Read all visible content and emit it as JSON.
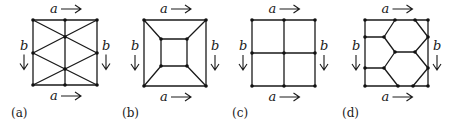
{
  "figure": {
    "panels": [
      {
        "id": "a",
        "caption": "(a)",
        "caption_pos": [
          11,
          117
        ],
        "edge_label_horizontal": "a",
        "edge_label_vertical": "b",
        "square": {
          "x0": 33,
          "y0": 20,
          "x1": 97,
          "y1": 85
        },
        "nodes": [
          [
            33,
            20
          ],
          [
            65,
            20
          ],
          [
            97,
            20
          ],
          [
            33,
            53
          ],
          [
            97,
            53
          ],
          [
            65,
            37
          ],
          [
            65,
            69
          ],
          [
            33,
            85
          ],
          [
            65,
            85
          ],
          [
            97,
            85
          ]
        ],
        "edges": [
          [
            [
              33,
              20
            ],
            [
              97,
              20
            ]
          ],
          [
            [
              33,
              85
            ],
            [
              97,
              85
            ]
          ],
          [
            [
              33,
              20
            ],
            [
              33,
              85
            ]
          ],
          [
            [
              97,
              20
            ],
            [
              97,
              85
            ]
          ],
          [
            [
              65,
              20
            ],
            [
              65,
              85
            ]
          ],
          [
            [
              33,
              20
            ],
            [
              97,
              53
            ]
          ],
          [
            [
              97,
              20
            ],
            [
              33,
              53
            ]
          ],
          [
            [
              33,
              53
            ],
            [
              97,
              85
            ]
          ],
          [
            [
              97,
              53
            ],
            [
              33,
              85
            ]
          ]
        ]
      },
      {
        "id": "b",
        "caption": "(b)",
        "caption_pos": [
          122,
          117
        ],
        "edge_label_horizontal": "a",
        "edge_label_vertical": "b",
        "square": {
          "x0": 144,
          "y0": 20,
          "x1": 206,
          "y1": 86
        },
        "nodes": [
          [
            144,
            20
          ],
          [
            206,
            20
          ],
          [
            144,
            86
          ],
          [
            206,
            86
          ],
          [
            161,
            39
          ],
          [
            187,
            39
          ],
          [
            161,
            66
          ],
          [
            187,
            66
          ]
        ],
        "edges": [
          [
            [
              144,
              20
            ],
            [
              206,
              20
            ]
          ],
          [
            [
              144,
              86
            ],
            [
              206,
              86
            ]
          ],
          [
            [
              144,
              20
            ],
            [
              144,
              86
            ]
          ],
          [
            [
              206,
              20
            ],
            [
              206,
              86
            ]
          ],
          [
            [
              161,
              39
            ],
            [
              187,
              39
            ]
          ],
          [
            [
              161,
              66
            ],
            [
              187,
              66
            ]
          ],
          [
            [
              161,
              39
            ],
            [
              161,
              66
            ]
          ],
          [
            [
              187,
              39
            ],
            [
              187,
              66
            ]
          ],
          [
            [
              144,
              20
            ],
            [
              161,
              39
            ]
          ],
          [
            [
              206,
              20
            ],
            [
              187,
              39
            ]
          ],
          [
            [
              144,
              86
            ],
            [
              161,
              66
            ]
          ],
          [
            [
              206,
              86
            ],
            [
              187,
              66
            ]
          ]
        ]
      },
      {
        "id": "c",
        "caption": "(c)",
        "caption_pos": [
          232,
          117
        ],
        "edge_label_horizontal": "a",
        "edge_label_vertical": "b",
        "square": {
          "x0": 252,
          "y0": 20,
          "x1": 315,
          "y1": 86
        },
        "nodes": [
          [
            252,
            20
          ],
          [
            284,
            20
          ],
          [
            315,
            20
          ],
          [
            252,
            53
          ],
          [
            284,
            53
          ],
          [
            315,
            53
          ],
          [
            252,
            86
          ],
          [
            284,
            86
          ],
          [
            315,
            86
          ]
        ],
        "edges": [
          [
            [
              252,
              20
            ],
            [
              315,
              20
            ]
          ],
          [
            [
              252,
              86
            ],
            [
              315,
              86
            ]
          ],
          [
            [
              252,
              20
            ],
            [
              252,
              86
            ]
          ],
          [
            [
              315,
              20
            ],
            [
              315,
              86
            ]
          ],
          [
            [
              284,
              20
            ],
            [
              284,
              86
            ]
          ],
          [
            [
              252,
              53
            ],
            [
              315,
              53
            ]
          ]
        ]
      },
      {
        "id": "d",
        "caption": "(d)",
        "caption_pos": [
          342,
          117
        ],
        "edge_label_horizontal": "a",
        "edge_label_vertical": "b",
        "square": {
          "x0": 365,
          "y0": 20,
          "x1": 428,
          "y1": 86
        },
        "nodes": [
          [
            365,
            20
          ],
          [
            395,
            20
          ],
          [
            415,
            20
          ],
          [
            428,
            20
          ],
          [
            365,
            37
          ],
          [
            384,
            37
          ],
          [
            428,
            37
          ],
          [
            395,
            52
          ],
          [
            415,
            52
          ],
          [
            365,
            68
          ],
          [
            384,
            68
          ],
          [
            428,
            68
          ],
          [
            365,
            86
          ],
          [
            398,
            86
          ],
          [
            413,
            86
          ],
          [
            428,
            86
          ]
        ],
        "edges": [
          [
            [
              365,
              20
            ],
            [
              428,
              20
            ]
          ],
          [
            [
              365,
              86
            ],
            [
              428,
              86
            ]
          ],
          [
            [
              365,
              20
            ],
            [
              365,
              86
            ]
          ],
          [
            [
              428,
              20
            ],
            [
              428,
              86
            ]
          ],
          [
            [
              365,
              37
            ],
            [
              384,
              37
            ]
          ],
          [
            [
              384,
              37
            ],
            [
              395,
              20
            ]
          ],
          [
            [
              384,
              37
            ],
            [
              395,
              52
            ]
          ],
          [
            [
              415,
              20
            ],
            [
              428,
              37
            ]
          ],
          [
            [
              428,
              37
            ],
            [
              415,
              52
            ]
          ],
          [
            [
              395,
              52
            ],
            [
              415,
              52
            ]
          ],
          [
            [
              365,
              68
            ],
            [
              384,
              68
            ]
          ],
          [
            [
              384,
              68
            ],
            [
              395,
              52
            ]
          ],
          [
            [
              415,
              52
            ],
            [
              428,
              68
            ]
          ],
          [
            [
              384,
              68
            ],
            [
              398,
              86
            ]
          ],
          [
            [
              428,
              68
            ],
            [
              413,
              86
            ]
          ]
        ]
      }
    ]
  }
}
